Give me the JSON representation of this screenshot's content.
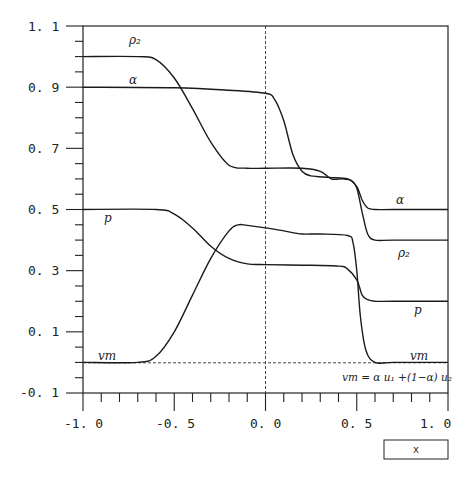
{
  "chart_data": {
    "type": "line",
    "title": "",
    "xlabel": "x",
    "ylabel": "",
    "xlim": [
      -1.0,
      1.0
    ],
    "ylim": [
      -0.1,
      1.1
    ],
    "grid": false,
    "legend": "inline curve labels",
    "x_ticks": [
      "-1.0",
      "-0.5",
      "0.0",
      "0.5",
      "1.0"
    ],
    "y_ticks": [
      "-0.1",
      "0.1",
      "0.3",
      "0.5",
      "0.7",
      "0.9",
      "1.1"
    ],
    "reference_lines": [
      {
        "type": "vertical",
        "x": 0.0,
        "style": "dashed"
      },
      {
        "type": "horizontal",
        "y": 0.0,
        "style": "dashed"
      }
    ],
    "annotations": [
      {
        "text": "vm = α u1 + (1−α) u2",
        "x": 0.72,
        "y": -0.05
      }
    ],
    "series": [
      {
        "name": "ρ2",
        "label_positions": [
          {
            "text": "ρ2",
            "x": -0.74,
            "y": 1.03
          },
          {
            "text": "ρ2",
            "x": 0.76,
            "y": 0.35
          }
        ],
        "x": [
          -1.0,
          -0.7,
          -0.6,
          -0.5,
          -0.4,
          -0.3,
          -0.2,
          -0.1,
          0.0,
          0.2,
          0.3,
          0.36,
          0.42,
          0.47,
          0.5,
          0.53,
          0.56,
          0.6,
          0.7,
          1.0
        ],
        "y": [
          1.0,
          1.0,
          0.99,
          0.93,
          0.83,
          0.72,
          0.645,
          0.635,
          0.635,
          0.635,
          0.625,
          0.6,
          0.6,
          0.595,
          0.57,
          0.49,
          0.42,
          0.4,
          0.4,
          0.4
        ]
      },
      {
        "name": "α",
        "label_positions": [
          {
            "text": "α",
            "x": -0.74,
            "y": 0.92
          },
          {
            "text": "α",
            "x": 0.76,
            "y": 0.53
          }
        ],
        "x": [
          -1.0,
          -0.5,
          -0.2,
          0.0,
          0.05,
          0.1,
          0.15,
          0.2,
          0.25,
          0.35,
          0.45,
          0.5,
          0.53,
          0.56,
          0.6,
          0.7,
          1.0
        ],
        "y": [
          0.9,
          0.898,
          0.89,
          0.88,
          0.86,
          0.79,
          0.68,
          0.625,
          0.61,
          0.605,
          0.6,
          0.575,
          0.53,
          0.505,
          0.5,
          0.5,
          0.5
        ],
        "__comment": ""
      },
      {
        "name": "p",
        "label_positions": [
          {
            "text": "p",
            "x": -0.87,
            "y": 0.47
          },
          {
            "text": "p",
            "x": 0.76,
            "y": 0.14
          }
        ],
        "x": [
          -1.0,
          -0.6,
          -0.5,
          -0.4,
          -0.3,
          -0.2,
          -0.1,
          0.0,
          0.2,
          0.4,
          0.45,
          0.5,
          0.53,
          0.56,
          0.6,
          0.7,
          1.0
        ],
        "y": [
          0.5,
          0.5,
          0.485,
          0.44,
          0.38,
          0.34,
          0.322,
          0.32,
          0.318,
          0.315,
          0.305,
          0.27,
          0.22,
          0.205,
          0.2,
          0.2,
          0.2
        ]
      },
      {
        "name": "vm",
        "label_positions": [
          {
            "text": "vm",
            "x": -0.88,
            "y": 0.005
          },
          {
            "text": "vm",
            "x": 0.78,
            "y": 0.005
          }
        ],
        "x": [
          -1.0,
          -0.7,
          -0.6,
          -0.5,
          -0.4,
          -0.3,
          -0.2,
          -0.15,
          -0.1,
          0.0,
          0.1,
          0.2,
          0.3,
          0.45,
          0.48,
          0.5,
          0.52,
          0.55,
          0.6,
          0.7,
          1.0
        ],
        "y": [
          0.0,
          0.0,
          0.02,
          0.1,
          0.22,
          0.34,
          0.43,
          0.45,
          0.448,
          0.44,
          0.43,
          0.42,
          0.42,
          0.415,
          0.39,
          0.3,
          0.15,
          0.04,
          0.0,
          0.0,
          0.0
        ]
      }
    ]
  },
  "axes": {
    "y_tick_labels": [
      "1. 1",
      "0. 9",
      "0. 7",
      "0. 5",
      "0. 3",
      "0. 1",
      "-0. 1"
    ],
    "x_tick_labels": [
      "-1. 0",
      "-0. 5",
      "0. 0",
      "0. 5",
      "1. 0"
    ],
    "xlabel_box": "x"
  },
  "labels": {
    "rho2_left": "ρ₂",
    "rho2_right": "ρ₂",
    "alpha_left": "α",
    "alpha_right": "α",
    "p_left": "p",
    "p_right": "p",
    "vm_left": "vm",
    "vm_right": "vm",
    "formula": "vm = α u₁ +(1−α) u₂"
  }
}
